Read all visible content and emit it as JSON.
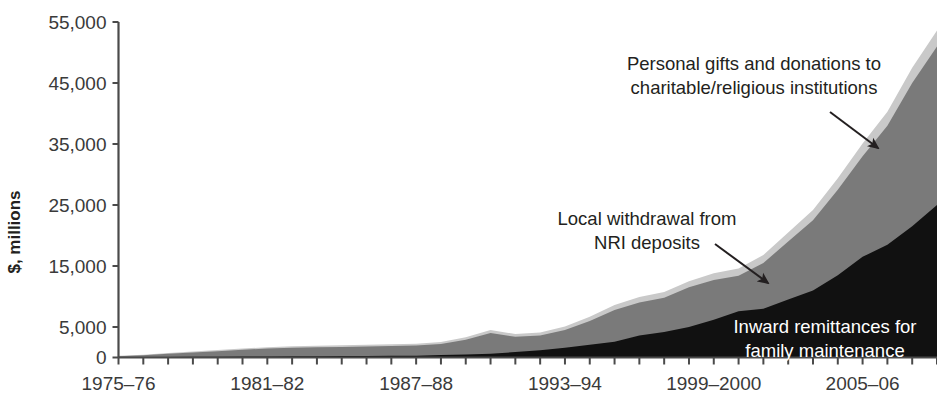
{
  "chart_data": {
    "type": "area",
    "stacked": true,
    "title": "",
    "xlabel": "",
    "ylabel": "$, millions",
    "ylim": [
      0,
      55000
    ],
    "yticks": [
      0,
      5000,
      15000,
      25000,
      35000,
      45000,
      55000
    ],
    "ytick_labels": [
      "0",
      "5,000",
      "15,000",
      "25,000",
      "35,000",
      "45,000",
      "55,000"
    ],
    "grid": false,
    "legend_position": "inline-annotations",
    "x": [
      "1975-76",
      "1976-77",
      "1977-78",
      "1978-79",
      "1979-80",
      "1980-81",
      "1981-82",
      "1982-83",
      "1983-84",
      "1984-85",
      "1985-86",
      "1986-87",
      "1987-88",
      "1988-89",
      "1989-90",
      "1990-91",
      "1991-92",
      "1992-93",
      "1993-94",
      "1994-95",
      "1995-96",
      "1996-97",
      "1997-98",
      "1998-99",
      "1999-2000",
      "2000-01",
      "2001-02",
      "2002-03",
      "2003-04",
      "2004-05",
      "2005-06",
      "2006-07",
      "2007-08",
      "2008-09"
    ],
    "xtick_labels": [
      "1975-76",
      "1981-82",
      "1987-88",
      "1993-94",
      "1999-2000",
      "2005-06"
    ],
    "xtick_indices": [
      0,
      6,
      12,
      18,
      24,
      30
    ],
    "series": [
      {
        "name": "Inward remittances for family maintenance",
        "color": "#111111",
        "values": [
          60,
          80,
          100,
          120,
          140,
          160,
          180,
          200,
          220,
          240,
          260,
          280,
          300,
          420,
          500,
          600,
          900,
          1200,
          1600,
          2100,
          2600,
          3600,
          4200,
          5000,
          6200,
          7600,
          8000,
          9500,
          11000,
          13500,
          16500,
          18500,
          21500,
          25000
        ]
      },
      {
        "name": "Local withdrawal from NRI deposits",
        "color": "#7a7a7a",
        "values": [
          150,
          300,
          500,
          700,
          900,
          1100,
          1300,
          1400,
          1450,
          1500,
          1550,
          1600,
          1650,
          1800,
          2400,
          3400,
          2500,
          2400,
          2900,
          3900,
          5200,
          5400,
          5600,
          6500,
          6500,
          5800,
          7500,
          9500,
          11500,
          14000,
          16500,
          19500,
          23500,
          26000
        ]
      },
      {
        "name": "Personal gifts and donations to charitable/religious institutions",
        "color": "#c9c9c9",
        "values": [
          60,
          90,
          120,
          150,
          170,
          200,
          220,
          240,
          250,
          260,
          270,
          280,
          300,
          320,
          400,
          500,
          450,
          500,
          600,
          700,
          800,
          900,
          950,
          1000,
          1100,
          1200,
          1300,
          1500,
          1700,
          1900,
          2100,
          2300,
          2500,
          2600
        ]
      }
    ],
    "annotations": [
      {
        "id": "gifts",
        "lines": [
          "Personal gifts and donations to",
          "charitable/religious institutions"
        ],
        "text_x": 754,
        "text_y": 70,
        "arrow_from_x": 830,
        "arrow_from_y": 112,
        "arrow_to_x": 878,
        "arrow_to_y": 148,
        "color": "#231f20"
      },
      {
        "id": "nri",
        "lines": [
          "Local withdrawal from",
          "NRI deposits"
        ],
        "text_x": 647,
        "text_y": 225,
        "arrow_from_x": 715,
        "arrow_from_y": 244,
        "arrow_to_x": 768,
        "arrow_to_y": 283,
        "color": "#231f20"
      },
      {
        "id": "remittances",
        "lines": [
          "Inward remittances for",
          "family maintenance"
        ],
        "text_x": 825,
        "text_y": 333,
        "color": "#ffffff"
      }
    ]
  }
}
